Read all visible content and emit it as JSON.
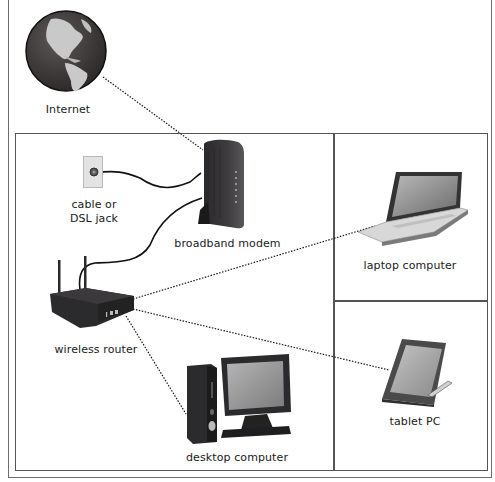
{
  "diagram": {
    "type": "home network diagram",
    "nodes": [
      {
        "id": "internet",
        "label": "Internet",
        "icon": "globe-icon"
      },
      {
        "id": "jack",
        "label_line1": "cable or",
        "label_line2": "DSL jack",
        "icon": "wall-jack-icon"
      },
      {
        "id": "modem",
        "label": "broadband modem",
        "icon": "modem-icon"
      },
      {
        "id": "router",
        "label": "wireless router",
        "icon": "router-icon"
      },
      {
        "id": "laptop",
        "label": "laptop computer",
        "icon": "laptop-icon"
      },
      {
        "id": "tablet",
        "label": "tablet PC",
        "icon": "tablet-icon"
      },
      {
        "id": "desktop",
        "label": "desktop computer",
        "icon": "desktop-icon"
      }
    ],
    "connections": [
      {
        "from": "internet",
        "to": "modem",
        "style": "dotted"
      },
      {
        "from": "jack",
        "to": "modem",
        "style": "cable"
      },
      {
        "from": "modem",
        "to": "router",
        "style": "cable"
      },
      {
        "from": "router",
        "to": "laptop",
        "style": "dotted"
      },
      {
        "from": "router",
        "to": "tablet",
        "style": "dotted"
      },
      {
        "from": "router",
        "to": "desktop",
        "style": "dotted"
      }
    ],
    "colors": {
      "line": "#1a1a1a",
      "border": "#555555",
      "globe_ocean": "#3e3a3a",
      "globe_land": "#c9c9c9",
      "device_dark": "#2e2c2e",
      "screen": "#9a9a9a"
    }
  }
}
